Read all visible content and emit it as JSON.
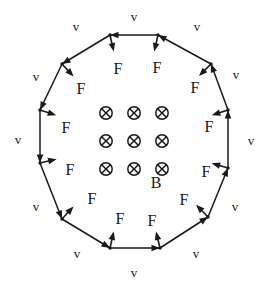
{
  "figure": {
    "width": 265,
    "height": 291,
    "background": "#ffffff",
    "stroke_color": "#1a1a1a",
    "text_color": "#1a1a1a"
  },
  "field": {
    "symbol_name": "field-into-page-symbol",
    "symbol_glyph": "⊗",
    "label": "B",
    "rows": 3,
    "columns": 3,
    "direction": "into-page",
    "grid": [
      [
        "⊗",
        "⊗",
        "⊗"
      ],
      [
        "⊗",
        "⊗",
        "⊗"
      ],
      [
        "⊗",
        "⊗",
        "⊗"
      ]
    ]
  },
  "polygon": {
    "sides": 12,
    "shape": "regular-dodecagon",
    "center": {
      "x": 134,
      "y": 141
    },
    "radius": 107,
    "vertices": [
      {
        "x": 158,
        "y": 35
      },
      {
        "x": 211,
        "y": 64
      },
      {
        "x": 228,
        "y": 110
      },
      {
        "x": 228,
        "y": 168
      },
      {
        "x": 208,
        "y": 217
      },
      {
        "x": 160,
        "y": 248
      },
      {
        "x": 110,
        "y": 248
      },
      {
        "x": 62,
        "y": 219
      },
      {
        "x": 40,
        "y": 163
      },
      {
        "x": 40,
        "y": 110
      },
      {
        "x": 62,
        "y": 64
      },
      {
        "x": 110,
        "y": 35
      }
    ]
  },
  "velocity_labels": [
    {
      "text": "v",
      "x": 134,
      "y": 16
    },
    {
      "text": "v",
      "x": 197,
      "y": 26
    },
    {
      "text": "v",
      "x": 236,
      "y": 74
    },
    {
      "text": "v",
      "x": 251,
      "y": 140
    },
    {
      "text": "v",
      "x": 235,
      "y": 206
    },
    {
      "text": "v",
      "x": 196,
      "y": 253
    },
    {
      "text": "v",
      "x": 134,
      "y": 272
    },
    {
      "text": "v",
      "x": 77,
      "y": 253
    },
    {
      "text": "v",
      "x": 36,
      "y": 206
    },
    {
      "text": "v",
      "x": 18,
      "y": 139
    },
    {
      "text": "v",
      "x": 36,
      "y": 76
    },
    {
      "text": "v",
      "x": 76,
      "y": 26
    }
  ],
  "force_labels": [
    {
      "text": "F",
      "x": 157,
      "y": 68
    },
    {
      "text": "F",
      "x": 195,
      "y": 88
    },
    {
      "text": "F",
      "x": 209,
      "y": 127
    },
    {
      "text": "F",
      "x": 206,
      "y": 172
    },
    {
      "text": "F",
      "x": 184,
      "y": 200
    },
    {
      "text": "F",
      "x": 152,
      "y": 221
    },
    {
      "text": "F",
      "x": 120,
      "y": 219
    },
    {
      "text": "F",
      "x": 92,
      "y": 199
    },
    {
      "text": "F",
      "x": 70,
      "y": 170
    },
    {
      "text": "F",
      "x": 66,
      "y": 128
    },
    {
      "text": "F",
      "x": 81,
      "y": 89
    },
    {
      "text": "F",
      "x": 118,
      "y": 69
    }
  ]
}
